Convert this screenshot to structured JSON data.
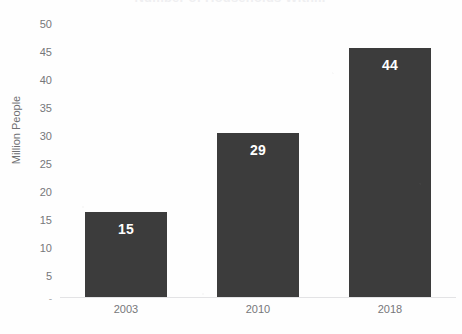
{
  "chart_data": {
    "type": "bar",
    "title": "Number of Households With...",
    "subtitle": "",
    "xlabel": "",
    "ylabel": "Million People",
    "categories": [
      "2003",
      "2010",
      "2018"
    ],
    "values": [
      15,
      29,
      44
    ],
    "value_labels": [
      "15",
      "29",
      "44"
    ],
    "ylim": [
      0,
      50
    ],
    "ytick_labels": [
      "50",
      "45",
      "40",
      "35",
      "30",
      "25",
      "20",
      "15",
      "10",
      "5",
      "-"
    ],
    "ytick_values": [
      50,
      45,
      40,
      35,
      30,
      25,
      20,
      15,
      10,
      5,
      0
    ],
    "grid": false,
    "legend": false,
    "legend_position": "none",
    "bar_color": "#3c3c3c",
    "value_label_color": "#ffffff",
    "axis_text_color": "#76777a",
    "background_color": "#ffffff",
    "baseline_color": "#e3e3e5"
  }
}
